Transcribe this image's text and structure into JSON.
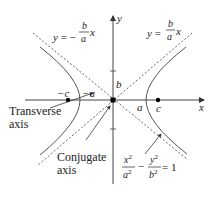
{
  "diagram": {
    "type": "hyperbola",
    "equation": {
      "x_num": "x",
      "x_exp": "2",
      "x_den": "a",
      "x_den_exp": "2",
      "minus": "−",
      "y_num": "y",
      "y_exp": "2",
      "y_den": "b",
      "y_den_exp": "2",
      "equals": "= 1"
    },
    "asymptote_left": {
      "lhs": "y = −",
      "num": "b",
      "den": "a",
      "var": "x"
    },
    "asymptote_right": {
      "lhs": "y =",
      "num": "b",
      "den": "a",
      "var": "x"
    },
    "axes": {
      "x_label": "x",
      "y_label": "y"
    },
    "points": {
      "neg_c": "−c",
      "neg_a": "−a",
      "a": "a",
      "c": "c",
      "b": "b"
    },
    "labels": {
      "transverse_line1": "Transverse",
      "transverse_line2": "axis",
      "conjugate_line1": "Conjugate",
      "conjugate_line2": "axis"
    },
    "colors": {
      "curve": "#555555",
      "axis": "#444444",
      "asymptote": "#555555",
      "text": "#222222",
      "point": "#000000"
    }
  }
}
